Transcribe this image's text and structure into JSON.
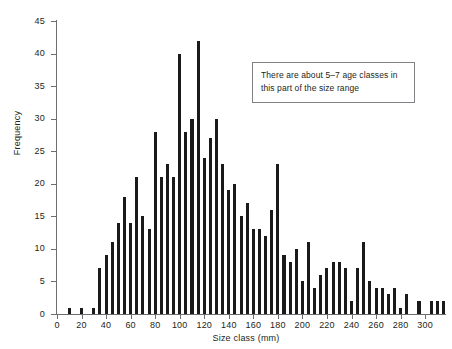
{
  "chart_data": {
    "type": "bar",
    "title": "",
    "subtitle": "",
    "xlabel": "Size class (mm)",
    "ylabel": "Frequency",
    "xlim": [
      0,
      317
    ],
    "ylim": [
      0,
      45
    ],
    "xticks": [
      0,
      20,
      40,
      60,
      80,
      100,
      120,
      140,
      160,
      180,
      200,
      220,
      240,
      260,
      280,
      300
    ],
    "yticks": [
      0,
      5,
      10,
      15,
      20,
      25,
      30,
      35,
      40,
      45
    ],
    "grid": false,
    "legend": null,
    "bar_width_mm": 2.5,
    "bin_step_mm": 5,
    "series_color": "#1a1a1a",
    "annotations": [
      {
        "name": "age-classes-note",
        "text": "There are about 5–7 age classes in this part of the size range",
        "x_mm": 160,
        "y_value": 38
      }
    ],
    "x": [
      10,
      15,
      20,
      25,
      30,
      35,
      40,
      45,
      50,
      55,
      60,
      65,
      70,
      75,
      80,
      85,
      90,
      95,
      100,
      105,
      110,
      115,
      120,
      125,
      130,
      135,
      140,
      145,
      150,
      155,
      160,
      165,
      170,
      175,
      180,
      185,
      190,
      195,
      200,
      205,
      210,
      215,
      220,
      225,
      230,
      235,
      240,
      245,
      250,
      255,
      260,
      265,
      270,
      275,
      280,
      285,
      290,
      295,
      300,
      305,
      310,
      315
    ],
    "values": [
      1,
      0,
      1,
      0,
      1,
      7,
      9,
      11,
      14,
      18,
      14,
      21,
      15,
      13,
      28,
      21,
      23,
      21,
      40,
      28,
      30,
      42,
      24,
      27,
      30,
      23,
      19,
      20,
      15,
      17,
      13,
      13,
      12,
      16,
      23,
      9,
      8,
      10,
      5,
      11,
      4,
      6,
      7,
      8,
      8,
      7,
      2,
      7,
      11,
      5,
      4,
      4,
      3,
      4,
      1,
      3,
      0,
      2,
      0,
      2,
      2,
      2
    ]
  },
  "axes": {
    "y_tick_labels": [
      "0",
      "5",
      "10",
      "15",
      "20",
      "25",
      "30",
      "35",
      "40",
      "45"
    ],
    "x_tick_labels": [
      "0",
      "20",
      "40",
      "60",
      "80",
      "100",
      "120",
      "140",
      "160",
      "180",
      "200",
      "220",
      "240",
      "260",
      "280",
      "300"
    ],
    "y_axis_title": "Frequency",
    "x_axis_title": "Size class (mm)"
  },
  "annotation": {
    "line1": "There are about 5–7 age classes in",
    "line2": "this part of the size range"
  },
  "colors": {
    "bar": "#1a1a1a",
    "axis": "#6d6e71",
    "text": "#231f20",
    "annotation_border": "#808285",
    "background": "#ffffff"
  }
}
